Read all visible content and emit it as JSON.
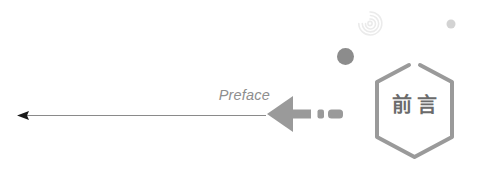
{
  "canvas": {
    "width": 485,
    "height": 171,
    "background": "#ffffff"
  },
  "banner": {
    "label_en": "Preface",
    "label_cn": "前言",
    "colors": {
      "text_en": "#8e8e8e",
      "text_cn": "#6b6b6b",
      "shield_stroke": "#9a9a9a",
      "thick_arrow": "#9a9a9a",
      "thin_arrow_line": "#8a8a8a",
      "thin_arrow_head": "#1a1a1a",
      "dot_dark": "#8c8c8c",
      "dot_light": "#d3d3d3",
      "rings": "#ededed"
    }
  },
  "elements": {
    "thin_arrow_name": "thin-left-arrow",
    "thick_arrow_name": "thick-left-arrow",
    "shield_name": "preface-shield",
    "rings_name": "concentric-rings-decoration",
    "dot_dark_name": "dark-dot-decoration",
    "dot_light_name": "light-dot-decoration"
  }
}
